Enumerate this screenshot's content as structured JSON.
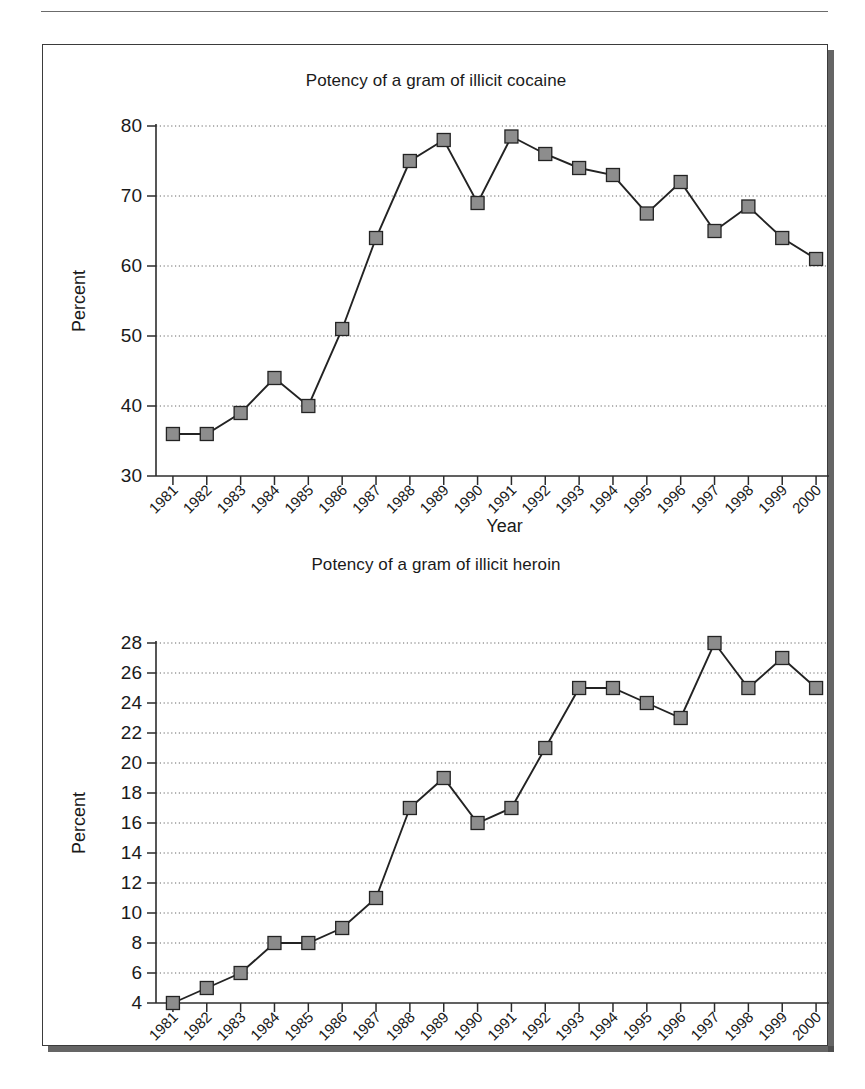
{
  "page": {
    "running_head": "",
    "year_axis_label": "Year",
    "percent_axis_label": "Percent"
  },
  "figure": {
    "charts": [
      {
        "id": "cocaine",
        "title": "Potency of a gram of illicit cocaine"
      },
      {
        "id": "heroin",
        "title": "Potency of a gram of illicit heroin"
      }
    ]
  },
  "chart_data": [
    {
      "type": "line",
      "id": "cocaine",
      "title": "Potency of a gram of illicit cocaine",
      "xlabel": "Year",
      "ylabel": "Percent",
      "ylim": [
        30,
        80
      ],
      "yticks": [
        30,
        40,
        50,
        60,
        70,
        80
      ],
      "grid": true,
      "legend": "none",
      "marker": "square",
      "categories": [
        "1981",
        "1982",
        "1983",
        "1984",
        "1985",
        "1986",
        "1987",
        "1988",
        "1989",
        "1990",
        "1991",
        "1992",
        "1993",
        "1994",
        "1995",
        "1996",
        "1997",
        "1998",
        "1999",
        "2000"
      ],
      "values": [
        36,
        36,
        39,
        44,
        40,
        51,
        64,
        75,
        78,
        69,
        78.5,
        76,
        74,
        73,
        67.5,
        72,
        65,
        68.5,
        64,
        61
      ]
    },
    {
      "type": "line",
      "id": "heroin",
      "title": "Potency of a gram of illicit heroin",
      "xlabel": "Year",
      "ylabel": "Percent",
      "ylim": [
        4,
        28
      ],
      "yticks": [
        4,
        6,
        8,
        10,
        12,
        14,
        16,
        18,
        20,
        22,
        24,
        26,
        28
      ],
      "grid": true,
      "legend": "none",
      "marker": "square",
      "categories": [
        "1981",
        "1982",
        "1983",
        "1984",
        "1985",
        "1986",
        "1987",
        "1988",
        "1989",
        "1990",
        "1991",
        "1992",
        "1993",
        "1994",
        "1995",
        "1996",
        "1997",
        "1998",
        "1999",
        "2000"
      ],
      "values": [
        4,
        5,
        6,
        8,
        8,
        9,
        11,
        17,
        19,
        16,
        17,
        21,
        25,
        25,
        24,
        23,
        28,
        25,
        27,
        25
      ]
    }
  ],
  "colors": {
    "marker_fill": "#8d8d8d",
    "line": "#232323",
    "grid": "#666666",
    "frame": "#3b3b3b"
  }
}
